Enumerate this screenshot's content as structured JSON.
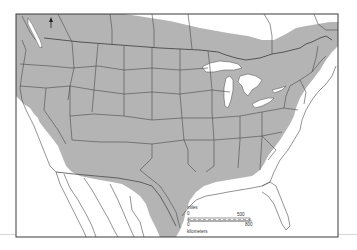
{
  "map": {
    "subject": "Species range map of North America (USA, southern Canada, northern Mexico)",
    "colors": {
      "range_fill": "#b4b4b4",
      "land_fill": "#ffffff",
      "water_fill": "#ffffff",
      "border_line": "#4a4a4a",
      "frame_line": "#3a3a3a"
    },
    "north_arrow": {
      "icon": "north-arrow-icon"
    },
    "scale_bar": {
      "miles_label": "miles",
      "miles_start": "0",
      "miles_end": "500",
      "km_label": "kilometers",
      "km_start": "0",
      "km_end": "800"
    },
    "legend": {
      "range_description": "Shaded area indicates range"
    }
  }
}
